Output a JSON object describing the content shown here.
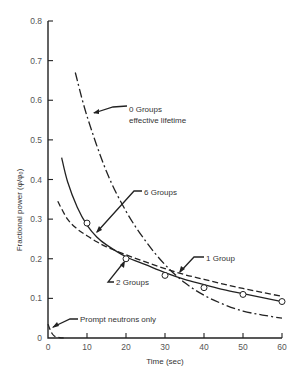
{
  "chart_data": {
    "type": "line",
    "title": "",
    "xlabel": "Time (sec)",
    "ylabel": "Fractional power (φ/φ₀)",
    "xlim": [
      0,
      60
    ],
    "ylim": [
      0,
      0.8
    ],
    "x_ticks": [
      0,
      10,
      20,
      30,
      40,
      50,
      60
    ],
    "x_tick_labels": [
      "0",
      "10",
      "20",
      "30",
      "40",
      "50",
      "60"
    ],
    "y_ticks": [
      0,
      0.1,
      0.2,
      0.3,
      0.4,
      0.5,
      0.6,
      0.7,
      0.8
    ],
    "y_tick_labels": [
      "0",
      "0.1",
      "0.2",
      "0.3",
      "0.4",
      "0.5",
      "0.6",
      "0.7",
      "0.8"
    ],
    "grid": false,
    "legend": "annotations",
    "series": [
      {
        "name": "0 Groups effective lifetime",
        "style": "dash-dot",
        "x": [
          7,
          10,
          15,
          20,
          25,
          30,
          35,
          40,
          45,
          50,
          55,
          60
        ],
        "y": [
          0.67,
          0.56,
          0.42,
          0.32,
          0.245,
          0.185,
          0.14,
          0.108,
          0.085,
          0.068,
          0.058,
          0.05
        ]
      },
      {
        "name": "6 Groups",
        "style": "solid",
        "x": [
          3.5,
          5,
          7.5,
          10,
          12.5,
          15,
          20,
          25,
          30,
          35,
          40,
          45,
          50,
          55,
          60
        ],
        "y": [
          0.455,
          0.395,
          0.33,
          0.285,
          0.255,
          0.235,
          0.205,
          0.185,
          0.165,
          0.148,
          0.135,
          0.122,
          0.112,
          0.102,
          0.092
        ]
      },
      {
        "name": "2 Groups",
        "style": "dashed",
        "x": [
          2.5,
          5,
          7.5,
          10,
          12.5,
          15,
          20,
          25,
          30,
          35,
          40,
          45,
          50,
          55,
          60
        ],
        "y": [
          0.345,
          0.3,
          0.275,
          0.258,
          0.243,
          0.23,
          0.21,
          0.192,
          0.175,
          0.16,
          0.148,
          0.136,
          0.125,
          0.115,
          0.105
        ]
      },
      {
        "name": "1 Group",
        "style": "circles",
        "x": [
          10,
          20,
          30,
          40,
          50,
          60
        ],
        "y": [
          0.29,
          0.2,
          0.158,
          0.127,
          0.11,
          0.092
        ]
      },
      {
        "name": "Prompt neutrons only",
        "style": "dashed",
        "x": [
          0,
          0.5,
          1,
          1.5,
          2,
          3,
          4
        ],
        "y": [
          0.035,
          0.022,
          0.012,
          0.006,
          0.003,
          0.001,
          0.0
        ]
      }
    ],
    "annotations": [
      {
        "text": [
          "0 Groups",
          "effective lifetime"
        ],
        "points_to": "0 Groups effective lifetime"
      },
      {
        "text": [
          "6 Groups"
        ],
        "points_to": "6 Groups"
      },
      {
        "text": [
          "2 Groups"
        ],
        "points_to": "2 Groups"
      },
      {
        "text": [
          "1 Group"
        ],
        "points_to": "1 Group"
      },
      {
        "text": [
          "Prompt neutrons only"
        ],
        "points_to": "Prompt neutrons only"
      }
    ]
  }
}
